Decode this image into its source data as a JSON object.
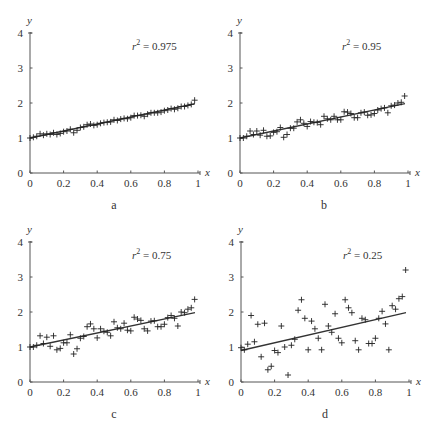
{
  "chart_data": [
    {
      "type": "scatter",
      "panel": "a",
      "title": "",
      "annotation": {
        "var": "r",
        "exp": "2",
        "text": " = 0.975"
      },
      "xlabel": "x",
      "ylabel": "y",
      "xlim": [
        0,
        1
      ],
      "ylim": [
        0,
        4
      ],
      "xticks": [
        "0",
        "0.2",
        "0.4",
        "0.6",
        "0.8",
        "1"
      ],
      "yticks": [
        "0",
        "1",
        "2",
        "3",
        "4"
      ],
      "fit_line": {
        "x": [
          0,
          1
        ],
        "y": [
          1,
          2
        ]
      },
      "points": {
        "x": [
          0.0,
          0.02,
          0.04,
          0.06,
          0.08,
          0.1,
          0.12,
          0.14,
          0.16,
          0.18,
          0.2,
          0.22,
          0.24,
          0.26,
          0.28,
          0.3,
          0.32,
          0.34,
          0.36,
          0.38,
          0.4,
          0.42,
          0.44,
          0.46,
          0.48,
          0.5,
          0.52,
          0.54,
          0.56,
          0.58,
          0.6,
          0.62,
          0.64,
          0.66,
          0.68,
          0.7,
          0.72,
          0.74,
          0.76,
          0.78,
          0.8,
          0.82,
          0.84,
          0.86,
          0.88,
          0.9,
          0.92,
          0.94,
          0.96,
          0.98
        ],
        "y": [
          1.0,
          1.02,
          1.05,
          1.12,
          1.08,
          1.12,
          1.1,
          1.15,
          1.1,
          1.13,
          1.18,
          1.2,
          1.25,
          1.15,
          1.22,
          1.3,
          1.32,
          1.38,
          1.4,
          1.36,
          1.38,
          1.42,
          1.44,
          1.45,
          1.46,
          1.52,
          1.5,
          1.54,
          1.56,
          1.55,
          1.58,
          1.64,
          1.64,
          1.65,
          1.62,
          1.68,
          1.72,
          1.72,
          1.72,
          1.74,
          1.78,
          1.8,
          1.84,
          1.82,
          1.85,
          1.9,
          1.9,
          1.93,
          1.96,
          2.08
        ]
      },
      "points_note": "approximate; positions estimated by eye from the zoomed image"
    },
    {
      "type": "scatter",
      "panel": "b",
      "title": "",
      "annotation": {
        "var": "r",
        "exp": "2",
        "text": " = 0.95"
      },
      "xlabel": "x",
      "ylabel": "y",
      "xlim": [
        0,
        1
      ],
      "ylim": [
        0,
        4
      ],
      "xticks": [
        "0",
        "0.2",
        "0.4",
        "0.6",
        "0.8",
        "1"
      ],
      "yticks": [
        "0",
        "1",
        "2",
        "3",
        "4"
      ],
      "fit_line": {
        "x": [
          0,
          1
        ],
        "y": [
          1,
          2
        ]
      },
      "points": {
        "x": [
          0.0,
          0.02,
          0.04,
          0.06,
          0.08,
          0.1,
          0.12,
          0.14,
          0.16,
          0.18,
          0.2,
          0.22,
          0.24,
          0.26,
          0.28,
          0.3,
          0.32,
          0.34,
          0.36,
          0.38,
          0.4,
          0.42,
          0.44,
          0.46,
          0.48,
          0.5,
          0.52,
          0.54,
          0.56,
          0.58,
          0.6,
          0.62,
          0.64,
          0.66,
          0.68,
          0.7,
          0.72,
          0.74,
          0.76,
          0.78,
          0.8,
          0.82,
          0.84,
          0.86,
          0.88,
          0.9,
          0.92,
          0.94,
          0.96,
          0.98
        ],
        "y": [
          1.0,
          1.0,
          1.05,
          1.2,
          1.1,
          1.2,
          1.08,
          1.22,
          1.05,
          1.06,
          1.16,
          1.18,
          1.3,
          1.02,
          1.1,
          1.28,
          1.28,
          1.46,
          1.52,
          1.42,
          1.33,
          1.47,
          1.45,
          1.44,
          1.38,
          1.62,
          1.55,
          1.52,
          1.62,
          1.52,
          1.52,
          1.75,
          1.74,
          1.7,
          1.58,
          1.58,
          1.72,
          1.74,
          1.65,
          1.66,
          1.7,
          1.8,
          1.84,
          1.86,
          1.72,
          1.92,
          1.94,
          2.0,
          2.02,
          2.2
        ]
      },
      "points_note": "approximate; positions estimated by eye from the zoomed image"
    },
    {
      "type": "scatter",
      "panel": "c",
      "title": "",
      "annotation": {
        "var": "r",
        "exp": "2",
        "text": " = 0.75"
      },
      "xlabel": "x",
      "ylabel": "y",
      "xlim": [
        0,
        1
      ],
      "ylim": [
        0,
        4
      ],
      "xticks": [
        "0",
        "0.2",
        "0.4",
        "0.6",
        "0.8",
        "1"
      ],
      "yticks": [
        "0",
        "1",
        "2",
        "3",
        "4"
      ],
      "fit_line": {
        "x": [
          0,
          1
        ],
        "y": [
          1,
          2
        ]
      },
      "points": {
        "x": [
          0.0,
          0.02,
          0.04,
          0.06,
          0.08,
          0.1,
          0.12,
          0.14,
          0.16,
          0.18,
          0.2,
          0.22,
          0.24,
          0.26,
          0.28,
          0.3,
          0.32,
          0.34,
          0.36,
          0.38,
          0.4,
          0.42,
          0.44,
          0.46,
          0.48,
          0.5,
          0.52,
          0.54,
          0.56,
          0.58,
          0.6,
          0.62,
          0.64,
          0.66,
          0.68,
          0.7,
          0.72,
          0.74,
          0.76,
          0.78,
          0.8,
          0.82,
          0.84,
          0.86,
          0.88,
          0.9,
          0.92,
          0.94,
          0.96,
          0.98
        ],
        "y": [
          1.0,
          1.0,
          1.05,
          1.32,
          1.1,
          1.28,
          1.02,
          1.32,
          0.92,
          0.96,
          1.12,
          1.12,
          1.35,
          0.8,
          0.95,
          1.25,
          1.3,
          1.58,
          1.66,
          1.52,
          1.26,
          1.52,
          1.45,
          1.42,
          1.32,
          1.72,
          1.55,
          1.52,
          1.68,
          1.48,
          1.46,
          1.85,
          1.8,
          1.76,
          1.52,
          1.46,
          1.74,
          1.75,
          1.58,
          1.58,
          1.65,
          1.84,
          1.9,
          1.82,
          1.6,
          2.0,
          1.98,
          2.08,
          2.12,
          2.36
        ]
      },
      "points_note": "approximate; positions estimated by eye from the zoomed image"
    },
    {
      "type": "scatter",
      "panel": "d",
      "title": "",
      "annotation": {
        "var": "r",
        "exp": "2",
        "text": " = 0.25"
      },
      "xlabel": "x",
      "ylabel": "y",
      "xlim": [
        0,
        1
      ],
      "ylim": [
        0,
        4
      ],
      "xticks": [
        "0",
        "0.2",
        "0.4",
        "0.6",
        "0.8",
        "1"
      ],
      "yticks": [
        "0",
        "1",
        "2",
        "3",
        "4"
      ],
      "fit_line": {
        "x": [
          0,
          1
        ],
        "y": [
          0.9,
          2.0
        ]
      },
      "points": {
        "x": [
          0.0,
          0.02,
          0.04,
          0.06,
          0.08,
          0.1,
          0.12,
          0.14,
          0.16,
          0.18,
          0.2,
          0.22,
          0.24,
          0.26,
          0.28,
          0.3,
          0.32,
          0.34,
          0.36,
          0.38,
          0.4,
          0.42,
          0.44,
          0.46,
          0.48,
          0.5,
          0.52,
          0.54,
          0.56,
          0.58,
          0.6,
          0.62,
          0.64,
          0.66,
          0.68,
          0.7,
          0.72,
          0.74,
          0.76,
          0.78,
          0.8,
          0.82,
          0.84,
          0.86,
          0.88,
          0.9,
          0.92,
          0.94,
          0.96,
          0.98
        ],
        "y": [
          0.98,
          0.92,
          1.08,
          1.9,
          1.15,
          1.65,
          0.72,
          1.68,
          0.35,
          0.45,
          0.9,
          0.84,
          1.6,
          1.0,
          0.2,
          1.05,
          1.22,
          2.05,
          2.35,
          1.82,
          0.92,
          1.74,
          1.52,
          1.25,
          0.92,
          2.22,
          1.6,
          1.42,
          1.95,
          1.25,
          1.12,
          2.35,
          2.12,
          1.98,
          1.18,
          0.92,
          1.82,
          1.78,
          1.1,
          1.1,
          1.25,
          1.82,
          2.02,
          1.66,
          0.92,
          2.18,
          2.08,
          2.38,
          2.44,
          3.2
        ]
      },
      "points_note": "approximate; positions estimated by eye from the zoomed image"
    }
  ]
}
